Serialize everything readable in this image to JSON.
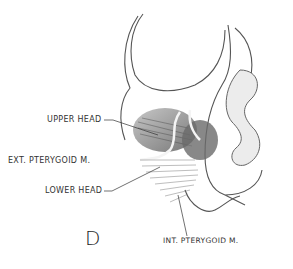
{
  "figure": {
    "panel_letter": "D",
    "labels": {
      "upper_head": "UPPER HEAD",
      "ext_pterygoid": "EXT. PTERYGOID M.",
      "lower_head": "LOWER HEAD",
      "int_pterygoid": "INT. PTERYGOID M."
    }
  }
}
